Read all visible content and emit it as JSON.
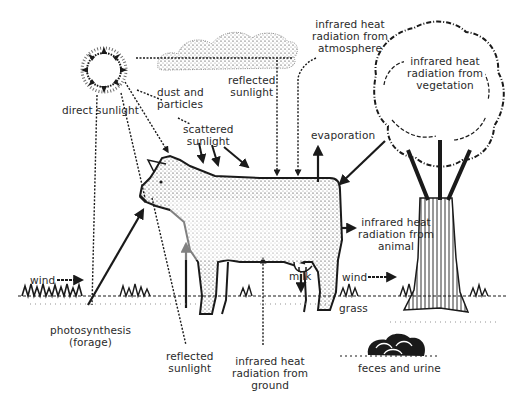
{
  "diagram": {
    "colors": {
      "ink": "#1a1a1a",
      "text": "#2a2a2a",
      "background": "#ffffff"
    },
    "labels": {
      "direct_sunlight": [
        "direct sunlight"
      ],
      "dust_particles": [
        "dust and",
        "particles"
      ],
      "scattered_sunlight": [
        "scattered",
        "sunlight"
      ],
      "reflected_sunlight_sky": [
        "reflected",
        "sunlight"
      ],
      "ir_atmosphere": [
        "infrared heat",
        "radiation from",
        "atmosphere"
      ],
      "ir_vegetation": [
        "infrared heat",
        "radiation from",
        "vegetation"
      ],
      "evaporation": [
        "evaporation"
      ],
      "ir_animal": [
        "infrared heat",
        "radiation from",
        "animal"
      ],
      "milk": [
        "milk"
      ],
      "wind_right": [
        "wind"
      ],
      "wind_left": [
        "wind"
      ],
      "grass": [
        "grass"
      ],
      "photosynthesis": [
        "photosynthesis",
        "(forage)"
      ],
      "reflected_sunlight_ground": [
        "reflected",
        "sunlight"
      ],
      "ir_ground": [
        "infrared heat",
        "radiation from",
        "ground"
      ],
      "feces_urine": [
        "feces and urine"
      ]
    },
    "icons": [
      "sun-icon",
      "cloud-icon",
      "cow-illustration",
      "tree-illustration",
      "feces-pile-icon",
      "grass-ground"
    ]
  }
}
